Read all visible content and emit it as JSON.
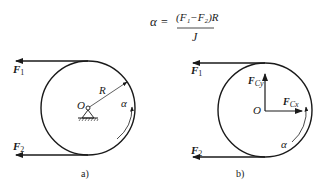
{
  "formula": {
    "lhs": "α",
    "equals": "=",
    "numerator": "(F₁−F₂)R",
    "denominator": "J"
  },
  "panel_a": {
    "caption": "a)",
    "labels": {
      "F1": "F",
      "F1_sub": "1",
      "F2": "F",
      "F2_sub": "2",
      "center": "O",
      "radius": "R",
      "angular_accel": "α"
    }
  },
  "panel_b": {
    "caption": "b)",
    "labels": {
      "F1": "F",
      "F1_sub": "1",
      "F2": "F",
      "F2_sub": "2",
      "center": "O",
      "Fcy": "F",
      "Fcy_sub": "Cy",
      "Fcx": "F",
      "Fcx_sub": "Cx",
      "angular_accel": "α"
    }
  },
  "colors": {
    "stroke": "#1a1a1a",
    "background": "#ffffff"
  }
}
